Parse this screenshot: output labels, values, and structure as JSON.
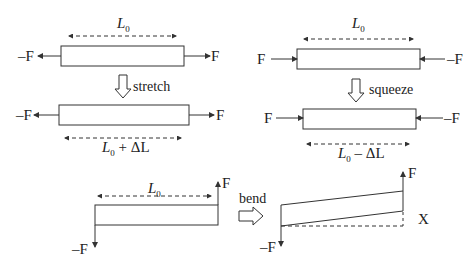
{
  "diagram": {
    "colors": {
      "stroke": "#333333",
      "text": "#222222",
      "background": "#ffffff"
    },
    "panels": {
      "stretch": {
        "top_length_label": {
          "main": "L",
          "sub": "0"
        },
        "bottom_length_label": {
          "main": "L",
          "sub": "0",
          "suffix": " + ΔL"
        },
        "left_force": "–F",
        "right_force": "F",
        "action_label": "stretch"
      },
      "squeeze": {
        "top_length_label": {
          "main": "L",
          "sub": "0"
        },
        "bottom_length_label": {
          "main": "L",
          "sub": "0",
          "suffix": " – ΔL"
        },
        "left_force": "F",
        "right_force": "–F",
        "action_label": "squeeze"
      },
      "bend": {
        "length_label": {
          "main": "L",
          "sub": "0"
        },
        "up_force": "F",
        "down_force": "–F",
        "action_label": "bend",
        "bent_up_force": "F",
        "bent_down_force": "–F",
        "deflection_label": "X"
      }
    }
  }
}
